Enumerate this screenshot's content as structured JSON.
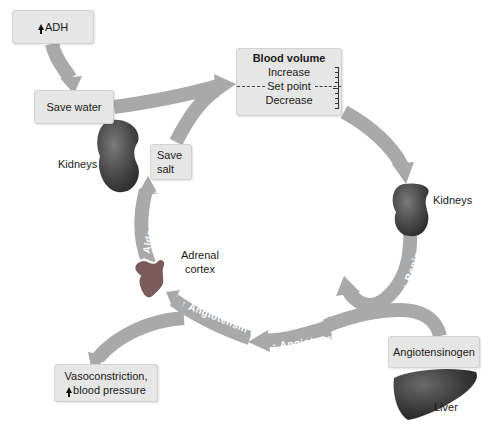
{
  "diagram": {
    "type": "renin-angiotensin-aldosterone system",
    "colors": {
      "arrow": "#a9a9a9",
      "box_fill": "#e6e6e6",
      "organ": "#4a4a4a",
      "arrow_text": "#ffffff"
    },
    "boxes": {
      "adh": {
        "label": "ADH",
        "indicator": "up-arrow"
      },
      "save_water": {
        "label": "Save water"
      },
      "blood_volume": {
        "title": "Blood volume",
        "increase": "Increase",
        "set_point": "Set point",
        "decrease": "Decrease"
      },
      "save_salt": {
        "line1": "Save",
        "line2": "salt"
      },
      "angiotensinogen": {
        "label": "Angiotensinogen"
      },
      "vasoconstriction": {
        "line1": "Vasoconstriction,",
        "line2": "blood pressure",
        "indicator": "up-arrow"
      }
    },
    "labels": {
      "kidneys_left": "Kidneys",
      "kidneys_right": "Kidneys",
      "adrenal_line1": "Adrenal",
      "adrenal_line2": "cortex",
      "liver": "Liver"
    },
    "arrow_labels": {
      "aldosterone": "↑ Aldosterone",
      "renin": "↑ Renin",
      "angiotensin_i": "↑ Angiotensin I",
      "angiotensin_ii": "↑ Angiotensin II"
    }
  }
}
